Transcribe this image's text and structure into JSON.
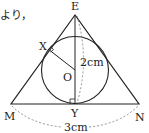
{
  "fragment_text": "より，",
  "points": {
    "E": "E",
    "X": "X",
    "O": "O",
    "M": "M",
    "Y": "Y",
    "N": "N"
  },
  "measurements": {
    "height": "2cm",
    "base": "3cm"
  },
  "colors": {
    "line": "#222222",
    "dashed": "#777777"
  }
}
